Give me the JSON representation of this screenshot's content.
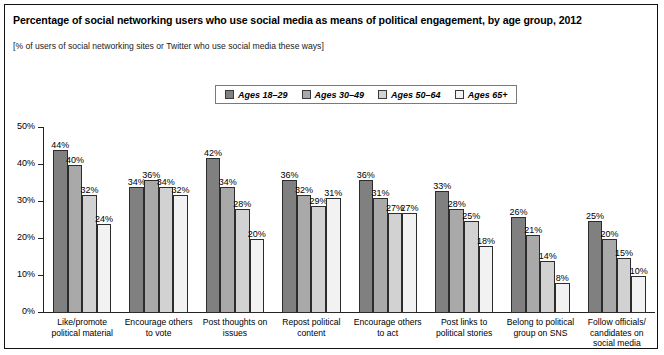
{
  "chart_data": {
    "type": "bar",
    "title": "Percentage of social networking users who use social media as means of political engagement, by age group, 2012",
    "subtitle": "[% of users of social networking sites or Twitter who use social media these ways]",
    "xlabel": "",
    "ylabel": "",
    "ylim": [
      0,
      50
    ],
    "ytick_labels": [
      "50%",
      "40%",
      "30%",
      "20%",
      "10%",
      "0%"
    ],
    "ytick_values": [
      50,
      40,
      30,
      20,
      10,
      0
    ],
    "grid": false,
    "legend_position": "top-center",
    "categories": [
      "Like/promote political material",
      "Encourage others to vote",
      "Post thoughts on issues",
      "Repost political content",
      "Encourage others to act",
      "Post links to political stories",
      "Belong to political group on SNS",
      "Follow officials/ candidates on social media"
    ],
    "series": [
      {
        "name": "Ages 18–29",
        "color": "#808080",
        "values": [
          44,
          34,
          42,
          36,
          36,
          33,
          26,
          25
        ],
        "labels": [
          "44%",
          "34%",
          "42%",
          "36%",
          "36%",
          "33%",
          "26%",
          "25%"
        ]
      },
      {
        "name": "Ages 30–49",
        "color": "#a9a9a9",
        "values": [
          40,
          36,
          34,
          32,
          31,
          28,
          21,
          20
        ],
        "labels": [
          "40%",
          "36%",
          "34%",
          "32%",
          "31%",
          "28%",
          "21%",
          "20%"
        ]
      },
      {
        "name": "Ages 50–64",
        "color": "#d2d2d2",
        "values": [
          32,
          34,
          28,
          29,
          27,
          25,
          14,
          15
        ],
        "labels": [
          "32%",
          "34%",
          "28%",
          "29%",
          "27%",
          "25%",
          "14%",
          "15%"
        ]
      },
      {
        "name": "Ages 65+",
        "color": "#f2f2f2",
        "values": [
          24,
          32,
          20,
          31,
          27,
          18,
          8,
          10
        ],
        "labels": [
          "24%",
          "32%",
          "20%",
          "31%",
          "27%",
          "18%",
          "8%",
          "10%"
        ]
      }
    ]
  }
}
